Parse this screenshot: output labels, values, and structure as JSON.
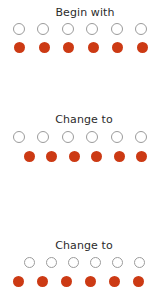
{
  "diagram": {
    "type": "one-to-one-correspondence",
    "background_color": "#ffffff",
    "filled_dot_color": "#cc3a14",
    "hollow_dot_stroke_color": "#9b9b9b",
    "label_text_color": "#2b2b2b",
    "panels": [
      {
        "id": "begin",
        "label": "Begin with",
        "rows": [
          {
            "id": "begin-hollow",
            "style": "hollow",
            "count": 6
          },
          {
            "id": "begin-filled",
            "style": "filled",
            "count": 6
          }
        ]
      },
      {
        "id": "change-1",
        "label": "Change to",
        "rows": [
          {
            "id": "change1-hollow",
            "style": "hollow",
            "count": 6
          },
          {
            "id": "change1-filled",
            "style": "filled",
            "count": 6
          }
        ]
      },
      {
        "id": "change-2",
        "label": "Change to",
        "rows": [
          {
            "id": "change2-hollow",
            "style": "hollow",
            "count": 6
          },
          {
            "id": "change2-filled",
            "style": "filled",
            "count": 6
          }
        ]
      }
    ]
  },
  "chart_data": {
    "type": "table",
    "title": "",
    "categories": [
      "Begin with",
      "Change to",
      "Change to"
    ],
    "series": [
      {
        "name": "hollow-circles",
        "values": [
          6,
          6,
          6
        ]
      },
      {
        "name": "filled-circles",
        "values": [
          6,
          6,
          6
        ]
      }
    ]
  }
}
